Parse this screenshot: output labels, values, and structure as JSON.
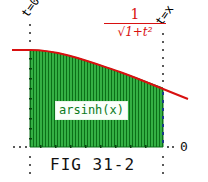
{
  "figure": {
    "caption": "FIG 31-2",
    "left_bound_label": "t=0",
    "right_bound_label": "t=x",
    "axis_zero_label": "0",
    "curve_label": {
      "numerator": "1",
      "denominator": "√1+t²"
    },
    "area_label": "arsinh(x)",
    "colors": {
      "curve": "#d81010",
      "area_fill": "#1e9a2e",
      "area_stripe": "#0b6f18",
      "area_label_text": "#0b7a1c",
      "boundary_dots": "#222222"
    }
  }
}
